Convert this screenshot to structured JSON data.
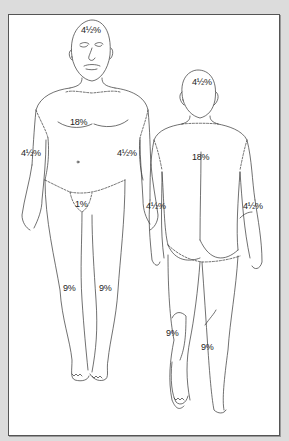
{
  "diagram": {
    "front_figure": {
      "head": "4½%",
      "torso": "18%",
      "left_arm": "4½%",
      "right_arm": "4½%",
      "groin": "1%",
      "left_leg": "9%",
      "right_leg": "9%"
    },
    "back_figure": {
      "head": "4½%",
      "torso": "18%",
      "left_arm": "4½%",
      "right_arm": "4½%",
      "left_leg": "9%",
      "right_leg": "9%"
    },
    "colors": {
      "background": "#dcdcdc",
      "panel": "#ffffff",
      "border": "#555555",
      "line": "#333333"
    }
  }
}
